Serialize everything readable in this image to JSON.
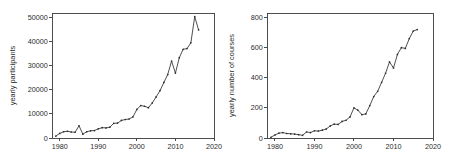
{
  "figure": {
    "background": "#ffffff",
    "line_color": "#2f2f2f",
    "axis_color": "#3a3a3a",
    "panel_count": 2
  },
  "chart_data": [
    {
      "id": "yearly-participants",
      "type": "line",
      "title": "",
      "xlabel": "",
      "ylabel": "yearly participants",
      "xlim": [
        1978,
        2020
      ],
      "ylim": [
        0,
        52000
      ],
      "xticks": [
        1980,
        1990,
        2000,
        2010,
        2020
      ],
      "xticklabels": [
        "1980",
        "1990",
        "2000",
        "2010",
        "2020"
      ],
      "yticks": [
        0,
        10000,
        20000,
        30000,
        40000,
        50000
      ],
      "yticklabels": [
        "0",
        "10000",
        "20000",
        "30000",
        "40000",
        "50000"
      ],
      "grid": false,
      "legend": "none",
      "markers": true,
      "x": [
        1979,
        1980,
        1981,
        1982,
        1983,
        1984,
        1985,
        1986,
        1987,
        1988,
        1989,
        1990,
        1991,
        1992,
        1993,
        1994,
        1995,
        1996,
        1997,
        1998,
        1999,
        2000,
        2001,
        2002,
        2003,
        2004,
        2005,
        2006,
        2007,
        2008,
        2009,
        2010,
        2011,
        2012,
        2013,
        2014,
        2015,
        2016
      ],
      "values": [
        800,
        1900,
        2600,
        2800,
        2500,
        2400,
        5100,
        1600,
        2600,
        3000,
        3100,
        3800,
        4300,
        4200,
        4500,
        6100,
        6200,
        7300,
        7700,
        7900,
        8800,
        11900,
        13500,
        13200,
        12600,
        14600,
        17100,
        19700,
        23100,
        26400,
        32000,
        27000,
        33400,
        36900,
        37200,
        39600,
        50500,
        45000
      ]
    },
    {
      "id": "yearly-number-of-courses",
      "type": "line",
      "title": "",
      "xlabel": "",
      "ylabel": "yearly number of courses",
      "xlim": [
        1978,
        2020
      ],
      "ylim": [
        0,
        830
      ],
      "xticks": [
        1980,
        1990,
        2000,
        2010,
        2020
      ],
      "xticklabels": [
        "1980",
        "1990",
        "2000",
        "2010",
        "2020"
      ],
      "yticks": [
        0,
        200,
        400,
        600,
        800
      ],
      "yticklabels": [
        "0",
        "200",
        "400",
        "600",
        "800"
      ],
      "grid": false,
      "legend": "none",
      "markers": true,
      "x": [
        1979,
        1980,
        1981,
        1982,
        1983,
        1984,
        1985,
        1986,
        1987,
        1988,
        1989,
        1990,
        1991,
        1992,
        1993,
        1994,
        1995,
        1996,
        1997,
        1998,
        1999,
        2000,
        2001,
        2002,
        2003,
        2004,
        2005,
        2006,
        2007,
        2008,
        2009,
        2010,
        2011,
        2012,
        2013,
        2014,
        2015,
        2016
      ],
      "values": [
        5,
        20,
        32,
        36,
        30,
        28,
        26,
        22,
        18,
        40,
        36,
        48,
        46,
        52,
        60,
        80,
        92,
        90,
        110,
        118,
        140,
        200,
        185,
        155,
        160,
        215,
        275,
        310,
        370,
        430,
        505,
        465,
        555,
        600,
        595,
        660,
        710,
        720
      ]
    }
  ]
}
